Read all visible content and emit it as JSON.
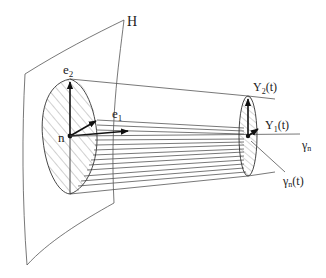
{
  "figure": {
    "type": "diagram",
    "labels": {
      "surface": "H",
      "basis_e2": "e",
      "basis_e2_sub": "2",
      "basis_e1": "e",
      "basis_e1_sub": "1",
      "base_point": "n",
      "jacobi_2": "Y",
      "jacobi_2_sub": "2",
      "jacobi_2_arg": "(t)",
      "jacobi_1": "Y",
      "jacobi_1_sub": "1",
      "jacobi_1_arg": "(t)",
      "geodesic": "γ",
      "geodesic_sub": "n",
      "geodesic_point": "γ",
      "geodesic_point_sub": "n",
      "geodesic_point_arg": "(t)"
    },
    "colors": {
      "stroke": "#333333",
      "background": "#ffffff"
    }
  }
}
